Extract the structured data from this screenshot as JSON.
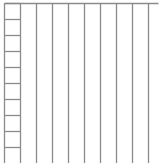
{
  "diagram": {
    "width": 161,
    "height": 163,
    "line_color": "#8a8a8a",
    "background": "#ffffff",
    "top_rail": {
      "x1": 4,
      "x2": 158,
      "y": 3
    },
    "vertical_lines_x": [
      4,
      20,
      36,
      52,
      68,
      84,
      100,
      116,
      132,
      148
    ],
    "vertical_y_range": [
      3,
      163
    ],
    "ladder": {
      "x1": 4,
      "x2": 20,
      "rungs_y": [
        3,
        19,
        35,
        51,
        67,
        83,
        99,
        115,
        131,
        147
      ]
    }
  }
}
